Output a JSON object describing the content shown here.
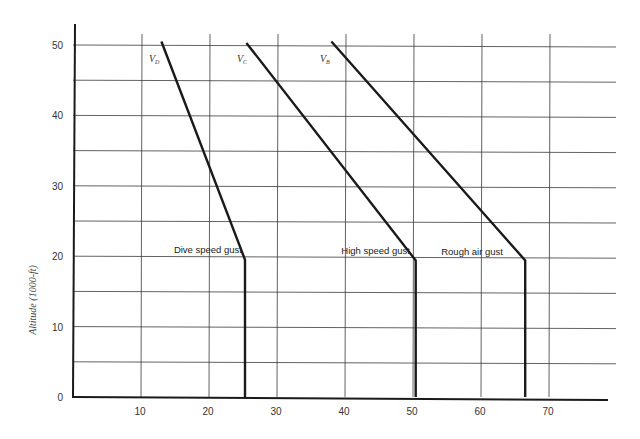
{
  "chart_data": {
    "type": "line",
    "title": "",
    "xlabel": "",
    "ylabel": "Altitude (1000-ft)",
    "xlim": [
      0,
      78
    ],
    "ylim": [
      0,
      53
    ],
    "x_ticks": [
      "10",
      "20",
      "30",
      "40",
      "50",
      "60",
      "70"
    ],
    "y_ticks": [
      "0",
      "10",
      "20",
      "30",
      "40",
      "50"
    ],
    "grid": {
      "x_step": 10,
      "y_step": 5,
      "on": true
    },
    "legend": "none (curves labeled inline)",
    "series": [
      {
        "name": "V_D",
        "label_main": "V",
        "label_sub": "D",
        "annotation": "Dive speed gust",
        "points": [
          [
            13,
            50.5
          ],
          [
            25.3,
            19.5
          ],
          [
            25.3,
            0
          ]
        ]
      },
      {
        "name": "V_C",
        "label_main": "V",
        "label_sub": "C",
        "annotation": "High speed gust",
        "points": [
          [
            25.5,
            50.3
          ],
          [
            50.4,
            19.4
          ],
          [
            50.4,
            0
          ]
        ]
      },
      {
        "name": "V_B",
        "label_main": "V",
        "label_sub": "B",
        "annotation": "Rough air gust",
        "points": [
          [
            38,
            50.5
          ],
          [
            66.5,
            19.4
          ],
          [
            66.5,
            0
          ]
        ]
      }
    ]
  }
}
